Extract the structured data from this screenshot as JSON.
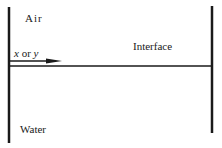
{
  "diagram": {
    "regions": {
      "upper": "Air",
      "lower": "Water"
    },
    "interface_label": "Interface",
    "axis_label": {
      "var1": "x",
      "conj": " or ",
      "var2": "y"
    },
    "colors": {
      "line": "#1a1a1a",
      "background": "#ffffff"
    }
  }
}
